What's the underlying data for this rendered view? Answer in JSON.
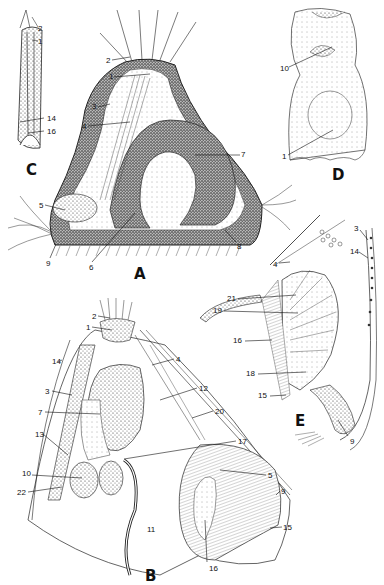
{
  "figure": {
    "panels": [
      {
        "id": "A",
        "letter": "A",
        "labels": [
          {
            "text": "2",
            "x": 106,
            "y": 57
          },
          {
            "text": "1",
            "x": 109,
            "y": 73
          },
          {
            "text": "3",
            "x": 92,
            "y": 103
          },
          {
            "text": "4",
            "x": 82,
            "y": 123
          },
          {
            "text": "7",
            "x": 241,
            "y": 151
          },
          {
            "text": "5",
            "x": 39,
            "y": 202
          },
          {
            "text": "9",
            "x": 46,
            "y": 260
          },
          {
            "text": "6",
            "x": 89,
            "y": 264
          },
          {
            "text": "8",
            "x": 237,
            "y": 243
          }
        ]
      },
      {
        "id": "C",
        "letter": "C",
        "labels": [
          {
            "text": "2",
            "x": 38,
            "y": 25
          },
          {
            "text": "1",
            "x": 38,
            "y": 38
          },
          {
            "text": "14",
            "x": 47,
            "y": 115
          },
          {
            "text": "16",
            "x": 47,
            "y": 128
          }
        ]
      },
      {
        "id": "D",
        "letter": "D",
        "labels": [
          {
            "text": "10",
            "x": 280,
            "y": 65
          },
          {
            "text": "1",
            "x": 282,
            "y": 153
          }
        ]
      },
      {
        "id": "E",
        "letter": "E",
        "labels": [
          {
            "text": "3",
            "x": 354,
            "y": 225
          },
          {
            "text": "14",
            "x": 350,
            "y": 248
          },
          {
            "text": "4",
            "x": 273,
            "y": 261
          },
          {
            "text": "21",
            "x": 227,
            "y": 295
          },
          {
            "text": "19",
            "x": 213,
            "y": 307
          },
          {
            "text": "16",
            "x": 233,
            "y": 337
          },
          {
            "text": "18",
            "x": 246,
            "y": 370
          },
          {
            "text": "15",
            "x": 258,
            "y": 392
          },
          {
            "text": "9",
            "x": 350,
            "y": 438
          }
        ]
      },
      {
        "id": "B",
        "letter": "B",
        "labels": [
          {
            "text": "2",
            "x": 92,
            "y": 313
          },
          {
            "text": "1",
            "x": 86,
            "y": 324
          },
          {
            "text": "14",
            "x": 52,
            "y": 358
          },
          {
            "text": "4",
            "x": 176,
            "y": 356
          },
          {
            "text": "3",
            "x": 45,
            "y": 388
          },
          {
            "text": "12",
            "x": 199,
            "y": 385
          },
          {
            "text": "7",
            "x": 38,
            "y": 409
          },
          {
            "text": "20",
            "x": 215,
            "y": 408
          },
          {
            "text": "13",
            "x": 35,
            "y": 431
          },
          {
            "text": "17",
            "x": 238,
            "y": 438
          },
          {
            "text": "10",
            "x": 22,
            "y": 470
          },
          {
            "text": "22",
            "x": 17,
            "y": 489
          },
          {
            "text": "5",
            "x": 268,
            "y": 472
          },
          {
            "text": "11",
            "x": 147,
            "y": 526
          },
          {
            "text": "9",
            "x": 281,
            "y": 488
          },
          {
            "text": "15",
            "x": 283,
            "y": 524
          },
          {
            "text": "16",
            "x": 209,
            "y": 565
          }
        ]
      }
    ],
    "panel_letter_positions": {
      "A": {
        "x": 134,
        "y": 265
      },
      "C": {
        "x": 26,
        "y": 161
      },
      "D": {
        "x": 332,
        "y": 166
      },
      "E": {
        "x": 295,
        "y": 412
      },
      "B": {
        "x": 145,
        "y": 567
      }
    }
  }
}
